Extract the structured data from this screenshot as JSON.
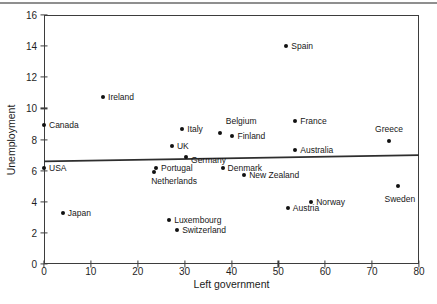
{
  "figure": {
    "background": "#ffffff",
    "top_rule_color": "#8f8f8f",
    "frame_color": "#3d3d3d"
  },
  "chart_data": {
    "type": "scatter",
    "title": "",
    "xlabel": "Left government",
    "ylabel": "Unemployment",
    "xlim": [
      0,
      80
    ],
    "ylim": [
      0,
      16
    ],
    "x_ticks": [
      0,
      10,
      20,
      30,
      40,
      50,
      60,
      70,
      80
    ],
    "y_ticks": [
      0,
      2,
      4,
      6,
      8,
      10,
      12,
      14,
      16
    ],
    "grid": false,
    "legend": false,
    "marker": {
      "shape": "circle",
      "color": "#111111",
      "size_px": 4
    },
    "points": [
      {
        "label": "Canada",
        "x": 0,
        "y": 8.9,
        "label_pos": "right"
      },
      {
        "label": "USA",
        "x": 0,
        "y": 6.2,
        "label_pos": "right"
      },
      {
        "label": "Japan",
        "x": 4,
        "y": 3.3,
        "label_pos": "right"
      },
      {
        "label": "Ireland",
        "x": 12.6,
        "y": 10.7,
        "label_pos": "right"
      },
      {
        "label": "Italy",
        "x": 29.5,
        "y": 8.7,
        "label_pos": "right"
      },
      {
        "label": "UK",
        "x": 27.3,
        "y": 7.6,
        "label_pos": "right"
      },
      {
        "label": "Germany",
        "x": 30.3,
        "y": 6.9,
        "label_pos": "right-below"
      },
      {
        "label": "Portugal",
        "x": 23.9,
        "y": 6.2,
        "label_pos": "right"
      },
      {
        "label": "Netherlands",
        "x": 23.5,
        "y": 5.9,
        "label_pos": "below-left"
      },
      {
        "label": "Luxembourg",
        "x": 26.7,
        "y": 2.8,
        "label_pos": "right"
      },
      {
        "label": "Switzerland",
        "x": 28.4,
        "y": 2.2,
        "label_pos": "right"
      },
      {
        "label": "Belgium",
        "x": 37.5,
        "y": 8.4,
        "label_pos": "above-right"
      },
      {
        "label": "Finland",
        "x": 40.2,
        "y": 8.2,
        "label_pos": "right"
      },
      {
        "label": "Denmark",
        "x": 38.1,
        "y": 6.2,
        "label_pos": "right"
      },
      {
        "label": "New Zealand",
        "x": 42.7,
        "y": 5.7,
        "label_pos": "right"
      },
      {
        "label": "Spain",
        "x": 51.7,
        "y": 14.0,
        "label_pos": "right"
      },
      {
        "label": "France",
        "x": 53.6,
        "y": 9.2,
        "label_pos": "right"
      },
      {
        "label": "Australia",
        "x": 53.6,
        "y": 7.3,
        "label_pos": "right"
      },
      {
        "label": "Austria",
        "x": 52.0,
        "y": 3.6,
        "label_pos": "right"
      },
      {
        "label": "Norway",
        "x": 57.0,
        "y": 4.0,
        "label_pos": "right"
      },
      {
        "label": "Greece",
        "x": 73.6,
        "y": 7.9,
        "label_pos": "above"
      },
      {
        "label": "Sweden",
        "x": 75.5,
        "y": 5.0,
        "label_pos": "below"
      }
    ],
    "trend_line": {
      "type": "linear",
      "x1": 0,
      "y1": 6.6,
      "x2": 80,
      "y2": 7.0,
      "color": "#2e2e2e",
      "width_px": 1.8
    }
  }
}
